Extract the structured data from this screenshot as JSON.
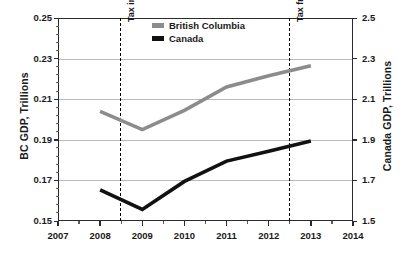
{
  "chart_data": {
    "type": "line",
    "title": "",
    "xlabel": "",
    "ylabel": "BC GDP, Trillions",
    "y2label": "Canada GDP, Trillions",
    "x": [
      2008,
      2009,
      2010,
      2011,
      2012,
      2013
    ],
    "xlim": [
      2007,
      2014
    ],
    "xticks": [
      "2007",
      "2008",
      "2009",
      "2010",
      "2011",
      "2012",
      "2013",
      "2014"
    ],
    "ylim": [
      0.15,
      0.25
    ],
    "yticks": [
      "0.25",
      "0.23",
      "0.21",
      "0.19",
      "0.17",
      "0.15"
    ],
    "y2lim": [
      1.5,
      2.5
    ],
    "y2ticks": [
      "2.5",
      "2.3",
      "2.1",
      "1.9",
      "1.7",
      "1.5"
    ],
    "grid": true,
    "legend_position": "top-center",
    "series": [
      {
        "name": "British Columbia",
        "axis": "left",
        "color": "#8c8c8c",
        "values": [
          0.204,
          0.195,
          0.2045,
          0.216,
          0.2215,
          0.2265
        ]
      },
      {
        "name": "Canada",
        "axis": "right",
        "color": "#111111",
        "values": [
          1.653,
          1.557,
          1.695,
          1.795,
          1.843,
          1.894
        ]
      }
    ],
    "annotations": [
      {
        "label": "Tax imposed",
        "x": 2008.5
      },
      {
        "label": "Tax frozen",
        "x": 2012.5
      }
    ]
  }
}
